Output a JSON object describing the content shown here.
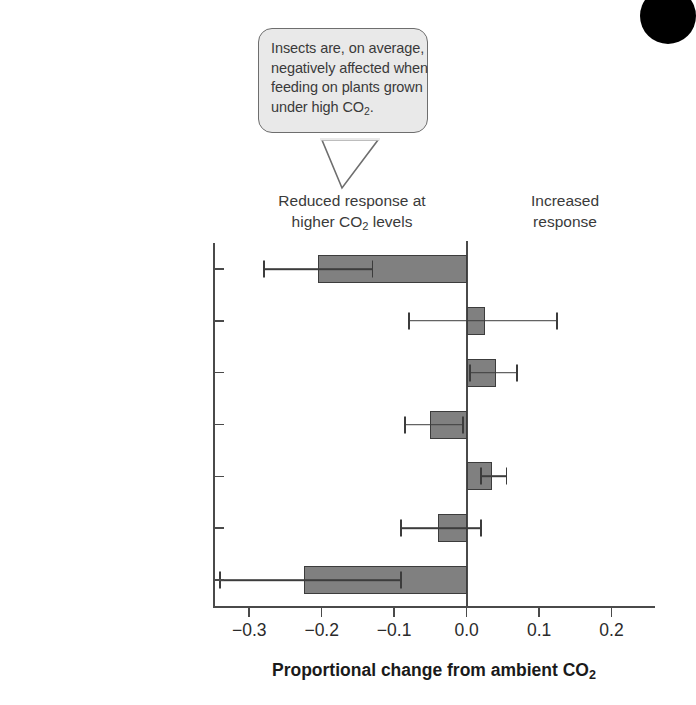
{
  "callout": {
    "lines": [
      "Insects are, on average,",
      "negatively affected when",
      "feeding on plants grown",
      "under high CO2."
    ],
    "line1": "Insects are, on average,",
    "line2": "negatively affected when",
    "line3": "feeding on plants grown",
    "line4_pre": "under high CO",
    "line4_sub": "2",
    "line4_post": "."
  },
  "annotations": {
    "left_note_line1": "Reduced response at",
    "left_note_line2_pre": "higher CO",
    "left_note_line2_sub": "2",
    "left_note_line2_post": " levels",
    "right_note_line1": "Increased",
    "right_note_line2": "response"
  },
  "axis_title": {
    "pre": "Proportional change from ambient CO",
    "sub": "2"
  },
  "colors": {
    "bar_fill": "#808080",
    "bar_stroke": "#3c3c3c",
    "axis": "#4a4a4a",
    "callout_bg": "#e9e9e9",
    "callout_border": "#6e6e6e",
    "corner_dot": "#000000"
  },
  "chart_data": {
    "type": "bar",
    "orientation": "horizontal",
    "title": "",
    "xlabel": "Proportional change from ambient CO2",
    "ylabel": "",
    "xlim": [
      -0.35,
      0.26
    ],
    "xticks": [
      -0.3,
      -0.2,
      -0.1,
      0.0,
      0.1,
      0.2
    ],
    "xticklabels": [
      "−0.3",
      "−0.2",
      "−0.1",
      "0.0",
      "0.1",
      "0.2"
    ],
    "grid": false,
    "legend": null,
    "categories": [
      "Conversion efficiency",
      "Relative damage",
      "Total consumption",
      "Pupal weight",
      "Development time",
      "Survival",
      "Abundance"
    ],
    "category_label_lines": [
      [
        "Conversion",
        "efficiency"
      ],
      [
        "Relative damage"
      ],
      [
        "Total consumption"
      ],
      [
        "Pupal weight"
      ],
      [
        "Development",
        "time"
      ],
      [
        "Survival"
      ],
      [
        "Abundance"
      ]
    ],
    "values": [
      -0.205,
      0.025,
      0.04,
      -0.05,
      0.035,
      -0.04,
      -0.225
    ],
    "error_low": [
      -0.28,
      -0.08,
      0.005,
      -0.085,
      0.02,
      -0.09,
      -0.34
    ],
    "error_high": [
      -0.13,
      0.125,
      0.07,
      -0.005,
      0.055,
      0.02,
      -0.09
    ],
    "series": [
      {
        "name": "Proportional change from ambient CO2",
        "values": [
          -0.205,
          0.025,
          0.04,
          -0.05,
          0.035,
          -0.04,
          -0.225
        ]
      }
    ]
  }
}
